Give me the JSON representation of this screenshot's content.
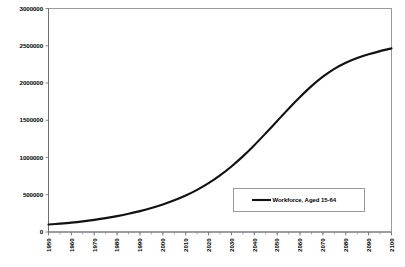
{
  "chart_data": {
    "type": "line",
    "title": "",
    "subtitle": "",
    "xlabel": "",
    "ylabel": "",
    "grid": false,
    "legend_position": "inside-lower-right",
    "xlim": [
      1950,
      2100
    ],
    "ylim": [
      0,
      3000000
    ],
    "x_ticks": [
      1950,
      1960,
      1970,
      1980,
      1990,
      2000,
      2010,
      2020,
      2030,
      2040,
      2050,
      2060,
      2070,
      2080,
      2090,
      2100
    ],
    "x_tick_labels": [
      "1950",
      "1960",
      "1970",
      "1980",
      "1990",
      "2000",
      "2010",
      "2020",
      "2030",
      "2040",
      "2050",
      "2060",
      "2070",
      "2080",
      "2090",
      "2100"
    ],
    "x_minor_tick_interval": 5,
    "y_ticks": [
      0,
      500000,
      1000000,
      1500000,
      2000000,
      2500000,
      3000000
    ],
    "y_tick_labels": [
      "0",
      "500000",
      "1000000",
      "1500000",
      "2000000",
      "2500000",
      "3000000"
    ],
    "series": [
      {
        "name": "Workforce, Aged 15-64",
        "color": "#111111",
        "x": [
          1950,
          1955,
          1960,
          1965,
          1970,
          1975,
          1980,
          1985,
          1990,
          1995,
          2000,
          2005,
          2010,
          2015,
          2020,
          2025,
          2030,
          2035,
          2040,
          2045,
          2050,
          2055,
          2060,
          2065,
          2070,
          2075,
          2080,
          2085,
          2090,
          2095,
          2100
        ],
        "values": [
          100000,
          112000,
          126000,
          143000,
          163000,
          186000,
          213000,
          244000,
          280000,
          321000,
          369000,
          425000,
          490000,
          566000,
          655000,
          760000,
          880000,
          1015000,
          1165000,
          1325000,
          1490000,
          1655000,
          1812000,
          1958000,
          2085000,
          2190000,
          2272000,
          2335000,
          2385000,
          2428000,
          2465000
        ]
      }
    ],
    "legend": [
      {
        "label": "Workforce, Aged 15-64",
        "color": "#111111"
      }
    ]
  },
  "colors": {
    "series_line": "#111111",
    "axis": "#6f6f6f",
    "plot_border": "#9a9a9a",
    "background": "#ffffff"
  }
}
